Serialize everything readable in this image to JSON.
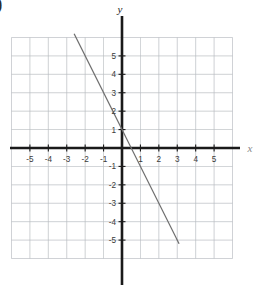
{
  "figure": {
    "leading_mark": ")",
    "background_color": "#ffffff"
  },
  "chart_data": {
    "type": "line",
    "title": "",
    "xlabel": "x",
    "ylabel": "y",
    "xlim": [
      -6,
      6
    ],
    "ylim": [
      -6,
      6
    ],
    "grid": true,
    "grid_color": "#b9bcc2",
    "axis_color": "#1a1a1a",
    "line_color": "#6e6e6e",
    "legend": "none",
    "x_tick_labels": [
      "-5",
      "-4",
      "-3",
      "-2",
      "-1",
      "1",
      "2",
      "3",
      "4",
      "5"
    ],
    "x_tick_values": [
      -5,
      -4,
      -3,
      -2,
      -1,
      1,
      2,
      3,
      4,
      5
    ],
    "y_tick_labels": [
      "5",
      "4",
      "3",
      "2",
      "1",
      "-1",
      "-2",
      "-3",
      "-4",
      "-5"
    ],
    "y_tick_values": [
      5,
      4,
      3,
      2,
      1,
      -1,
      -2,
      -3,
      -4,
      -5
    ],
    "series": [
      {
        "name": "y = -2x + 1",
        "equation": "y = -2x + 1",
        "slope": -2,
        "y_intercept": 1,
        "x_intercept": 0.5,
        "x": [
          -2.6,
          3.1
        ],
        "y": [
          6.2,
          -5.2
        ]
      }
    ]
  },
  "axes_labels": {
    "x_axis": "x",
    "y_axis": "y"
  }
}
